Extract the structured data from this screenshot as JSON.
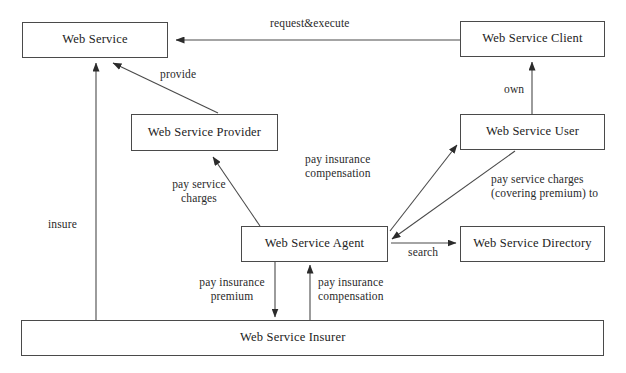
{
  "diagram": {
    "background_color": "#ffffff",
    "line_color": "#4a4a4a",
    "text_color": "#222222",
    "nodes": [
      {
        "id": "web_service",
        "label": "Web Service",
        "x": 22,
        "y": 22,
        "w": 146,
        "h": 36
      },
      {
        "id": "web_service_client",
        "label": "Web Service Client",
        "x": 460,
        "y": 21,
        "w": 145,
        "h": 36
      },
      {
        "id": "web_service_provider",
        "label": "Web Service Provider",
        "x": 131,
        "y": 114,
        "w": 147,
        "h": 37
      },
      {
        "id": "web_service_user",
        "label": "Web Service User",
        "x": 460,
        "y": 114,
        "w": 145,
        "h": 36
      },
      {
        "id": "web_service_agent",
        "label": "Web Service Agent",
        "x": 241,
        "y": 226,
        "w": 147,
        "h": 36
      },
      {
        "id": "web_service_directory",
        "label": "Web Service Directory",
        "x": 460,
        "y": 226,
        "w": 145,
        "h": 36
      },
      {
        "id": "web_service_insurer",
        "label": "Web Service Insurer",
        "x": 21,
        "y": 320,
        "w": 583,
        "h": 36
      }
    ],
    "edges": [
      {
        "id": "request_execute",
        "label": "request&execute",
        "from": "web_service_client",
        "to": "web_service"
      },
      {
        "id": "provide",
        "label": "provide",
        "from": "web_service_provider",
        "to": "web_service"
      },
      {
        "id": "own",
        "label": "own",
        "from": "web_service_user",
        "to": "web_service_client"
      },
      {
        "id": "pay_service_charges",
        "label": "pay service\ncharges",
        "from": "web_service_agent",
        "to": "web_service_provider"
      },
      {
        "id": "pay_insurance_comp_user",
        "label": "pay insurance\ncompensation",
        "from": "web_service_agent",
        "to": "web_service_user"
      },
      {
        "id": "pay_charges_covering",
        "label": "pay service charges\n(covering premium) to",
        "from": "web_service_user",
        "to": "web_service_agent"
      },
      {
        "id": "search",
        "label": "search",
        "from": "web_service_agent",
        "to": "web_service_directory"
      },
      {
        "id": "insure",
        "label": "insure",
        "from": "web_service_insurer",
        "to": "web_service"
      },
      {
        "id": "pay_insurance_premium",
        "label": "pay insurance\npremium",
        "from": "web_service_agent",
        "to": "web_service_insurer"
      },
      {
        "id": "pay_insurance_comp_agent",
        "label": "pay insurance\ncompensation",
        "from": "web_service_insurer",
        "to": "web_service_agent"
      }
    ],
    "edge_labels": {
      "request_execute": {
        "line1": "request&execute",
        "line2": ""
      },
      "provide": {
        "line1": "provide",
        "line2": ""
      },
      "own": {
        "line1": "own",
        "line2": ""
      },
      "pay_service_charges": {
        "line1": "pay service",
        "line2": "charges"
      },
      "pay_insurance_comp_user": {
        "line1": "pay insurance",
        "line2": "compensation"
      },
      "pay_charges_covering": {
        "line1": "pay service charges",
        "line2": "(covering premium) to"
      },
      "search": {
        "line1": "search",
        "line2": ""
      },
      "insure": {
        "line1": "insure",
        "line2": ""
      },
      "pay_insurance_premium": {
        "line1": "pay insurance",
        "line2": "premium"
      },
      "pay_insurance_comp_agent": {
        "line1": "pay insurance",
        "line2": "compensation"
      }
    }
  }
}
